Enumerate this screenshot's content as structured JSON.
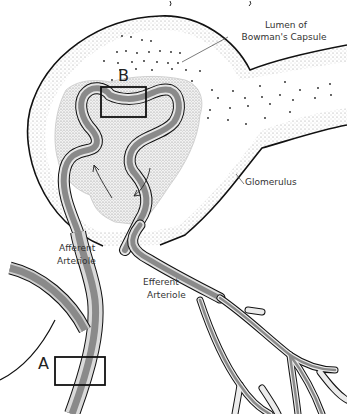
{
  "diagram": {
    "labels": {
      "lumen_line1": "Lumen of",
      "lumen_line2": "Bowman's Capsule",
      "glomerulus": "Glomerulus",
      "afferent_line1": "Afferent",
      "afferent_line2": "Arteriole",
      "efferent_line1": "Efferent",
      "efferent_line2": "Arteriole",
      "box_a": "A",
      "box_b": "B"
    },
    "colors": {
      "outline": "#111111",
      "vessel_fill": "#8a8a8a",
      "vessel_wall": "#d9d9d9",
      "stipple": "#bdbdbd",
      "label_text": "#333333",
      "background": "#ffffff"
    }
  }
}
